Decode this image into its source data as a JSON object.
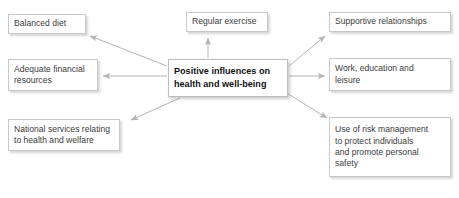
{
  "diagram": {
    "title": "Positive influences on health and well-being",
    "type": "radial-influence-map",
    "colors": {
      "box_border": "#c8c8c8",
      "box_background": "#ffffff",
      "arrow": "#b0b0b0",
      "text": "#3c3c3c",
      "center_text": "#111111",
      "page_background": "#ffffff"
    },
    "center": {
      "label": "Positive influences on\nhealth and well-being",
      "line1": "Positive influences on",
      "line2": "health and well-being",
      "bold": true
    },
    "nodes": [
      {
        "id": "balanced-diet",
        "label": "Balanced diet",
        "position": "top-left"
      },
      {
        "id": "regular-exercise",
        "label": "Regular exercise",
        "position": "top-center"
      },
      {
        "id": "supportive",
        "label": "Supportive relationships",
        "position": "top-right"
      },
      {
        "id": "adequate-financial",
        "label": "Adequate financial\nresources",
        "position": "middle-left"
      },
      {
        "id": "work-education",
        "label": "Work, education and\nleisure",
        "position": "middle-right"
      },
      {
        "id": "national-services",
        "label": "National services relating\nto health and welfare",
        "position": "bottom-left"
      },
      {
        "id": "risk-management",
        "label": "Use of risk management\nto protect individuals\nand promote personal\nsafety",
        "position": "bottom-right"
      }
    ],
    "arrows": [
      {
        "id": "arrow-to-balanced-diet",
        "from": "center",
        "to": "balanced-diet",
        "direction": "up-left"
      },
      {
        "id": "arrow-to-regular-exercise",
        "from": "center",
        "to": "regular-exercise",
        "direction": "up"
      },
      {
        "id": "arrow-to-supportive",
        "from": "center",
        "to": "supportive",
        "direction": "up-right"
      },
      {
        "id": "arrow-to-adequate-financial",
        "from": "center",
        "to": "adequate-financial",
        "direction": "left"
      },
      {
        "id": "arrow-to-work-education",
        "from": "center",
        "to": "work-education",
        "direction": "right"
      },
      {
        "id": "arrow-to-national-services",
        "from": "center",
        "to": "national-services",
        "direction": "down-left"
      },
      {
        "id": "arrow-to-risk-management",
        "from": "center",
        "to": "risk-management",
        "direction": "down-right"
      }
    ]
  }
}
